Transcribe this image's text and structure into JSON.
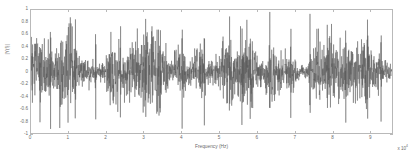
{
  "figure": {
    "background_color": "#ffffff",
    "axis_color": "#b9b9b9",
    "line_color": "#555555"
  },
  "axes": {
    "xlabel": "Frequency (Hz)",
    "ylabel": "|Y(f)|",
    "x_exponent_base": "x 10",
    "x_exponent_power": "4",
    "xticks": [
      0,
      1,
      2,
      3,
      4,
      5,
      6,
      7,
      8,
      9
    ],
    "xtick_labels": [
      "0",
      "1",
      "2",
      "3",
      "4",
      "5",
      "6",
      "7",
      "8",
      "9"
    ],
    "yticks": [
      -1,
      -0.8,
      -0.6,
      -0.4,
      -0.2,
      0,
      0.2,
      0.4,
      0.6,
      0.8,
      1
    ],
    "ytick_labels": [
      "-1",
      "-0.8",
      "-0.6",
      "-0.4",
      "-0.2",
      "0",
      "0.2",
      "0.4",
      "0.6",
      "0.8",
      "1"
    ]
  },
  "chart_data": {
    "type": "line",
    "title": "",
    "xlabel": "Frequency (Hz)",
    "ylabel": "|Y(f)|",
    "xlim": [
      0,
      9.6
    ],
    "ylim": [
      -1,
      1
    ],
    "x_scale_factor": 10000,
    "grid": false,
    "legend": null,
    "series": [
      {
        "name": "signal",
        "color": "#555555",
        "description": "Dense broadband noise-like oscillation, zero mean, amplitude envelope mostly within +/-0.5 with intermittent spikes reaching +/-1.0",
        "n_points": 2048,
        "envelope_mean": 0.28,
        "envelope_peak": 1.0,
        "seed": 20240517,
        "spike_positions": [
          0.52,
          1.18,
          1.72,
          2.38,
          3.05,
          3.44,
          4.02,
          4.61,
          5.28,
          5.83,
          6.35,
          6.91,
          7.42,
          7.88,
          8.37,
          8.95,
          9.31
        ],
        "spike_amplitudes": [
          0.98,
          1.0,
          0.86,
          0.92,
          0.99,
          0.83,
          1.0,
          0.88,
          0.95,
          0.81,
          0.97,
          0.9,
          1.0,
          0.84,
          0.93,
          1.0,
          0.87
        ]
      }
    ]
  }
}
